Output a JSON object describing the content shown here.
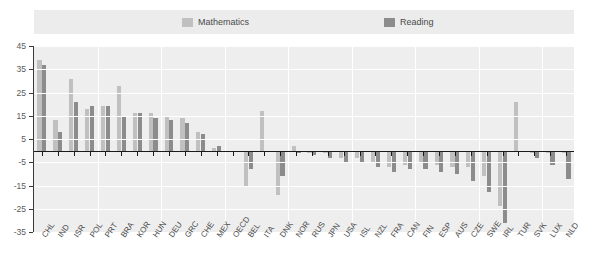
{
  "legend": {
    "items": [
      {
        "label": "Mathematics",
        "color": "#c0c0c0",
        "left_px": 182
      },
      {
        "label": "Reading",
        "color": "#8c8c8c",
        "left_px": 384
      }
    ]
  },
  "axes": {
    "y_ticks": [
      45,
      35,
      25,
      15,
      5,
      -5,
      -15,
      -25,
      -35
    ],
    "y_min": -35,
    "y_max": 45,
    "grid": true
  },
  "chart_data": {
    "type": "bar",
    "title": "",
    "subtitle": "",
    "xlabel": "",
    "ylabel": "",
    "ylim": [
      -35,
      45
    ],
    "grid": true,
    "legend_position": "top",
    "categories": [
      "CHL",
      "IND",
      "ISR",
      "POL",
      "PRT",
      "BRA",
      "KOR",
      "HUN",
      "DEU",
      "GRC",
      "CHE",
      "MEX",
      "OECD",
      "BEL",
      "ITA",
      "DNK",
      "NOR",
      "RUS",
      "JPN",
      "USA",
      "ISL",
      "NZL",
      "FRA",
      "CAN",
      "FIN",
      "ESP",
      "AUS",
      "CZE",
      "SWE",
      "IRL",
      "TUR",
      "SVK",
      "LUX",
      "NLD"
    ],
    "series": [
      {
        "name": "Mathematics",
        "color": "#c0c0c0",
        "values": [
          39,
          13,
          31,
          18,
          19,
          28,
          16,
          16,
          15,
          14,
          8,
          1,
          0,
          -15,
          17,
          -19,
          2,
          -1,
          -1,
          -3,
          -3,
          -5,
          -7,
          -6,
          -5,
          -6,
          -7,
          -7,
          -11,
          -24,
          21,
          -1,
          -1,
          -1
        ]
      },
      {
        "name": "Reading",
        "color": "#8c8c8c",
        "values": [
          37,
          8,
          21,
          19,
          19,
          15,
          16,
          14,
          13,
          12,
          7,
          2,
          0,
          -8,
          0,
          -11,
          -1,
          -2,
          -3,
          -5,
          -5,
          -7,
          -9,
          -8,
          -8,
          -9,
          -10,
          -13,
          -18,
          -31,
          0,
          -3,
          -6,
          -12
        ]
      }
    ]
  }
}
